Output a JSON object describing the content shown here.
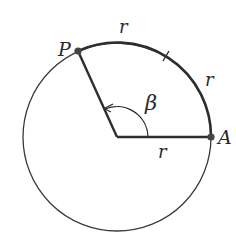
{
  "diagram": {
    "type": "circle-radian-illustration",
    "colors": {
      "stroke": "#3a3a3a",
      "thick_stroke": "#2e2e2e",
      "point": "#444444",
      "background": "#ffffff"
    },
    "points": {
      "P": {
        "label": "P"
      },
      "A": {
        "label": "A"
      }
    },
    "angle": {
      "label": "β"
    },
    "arc_labels": {
      "first": "r",
      "second": "r"
    },
    "radius_label": "r"
  }
}
